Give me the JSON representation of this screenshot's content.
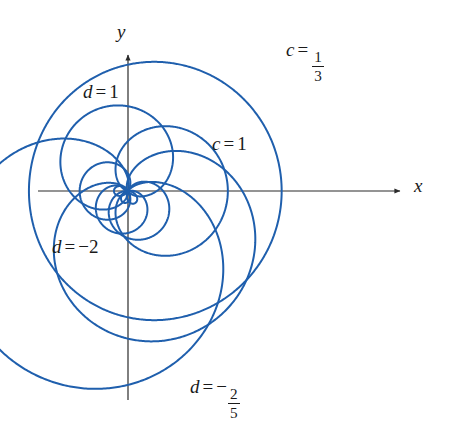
{
  "figure": {
    "name": "polar-limacon-family",
    "background": "#ffffff",
    "width": 451,
    "height": 425
  },
  "axes": {
    "x_label": "x",
    "y_label": "y",
    "color": "#2b2b2b",
    "origin": [
      128,
      191
    ],
    "x_start": 38,
    "x_end": 400,
    "y_start": 55,
    "y_end": 400,
    "arrow_x": true,
    "arrow_y": true,
    "ticks": false,
    "grid": false
  },
  "style": {
    "curve_color": "#1f5fad",
    "curve_width": 2.0,
    "text_color": "#1a1a1a"
  },
  "labels": {
    "c_onethird": {
      "var": "c",
      "eq": "=",
      "num": "1",
      "den": "3"
    },
    "c_one": {
      "var": "c",
      "eq": "=",
      "value": "1"
    },
    "d_one": {
      "var": "d",
      "eq": "=",
      "value": "1"
    },
    "d_minustwo": {
      "var": "d",
      "eq": "=",
      "value": "−2"
    },
    "d_minustwofifths": {
      "var": "d",
      "eq": "=",
      "neg": "−",
      "num": "2",
      "den": "5"
    }
  },
  "chart_data": {
    "type": "line",
    "title": "",
    "xlabel": "x",
    "ylabel": "y",
    "grid": false,
    "legend": "inline-annotations",
    "coordinate_system": "polar",
    "xlim": [
      -2.7,
      2.7
    ],
    "ylim": [
      -2.7,
      2.7
    ],
    "scale_px_per_unit": 78,
    "equation_family": "r = k / (1 + e*cos(theta - phi))  rendered as limacon r = a + b*cos(theta - phi)",
    "series": [
      {
        "name": "c = 1/3",
        "label": "c = 1/3",
        "param": "c",
        "value": 0.3333,
        "color": "#1f5fad",
        "a": 1.62,
        "b": 0.35,
        "phase_deg": 0,
        "description": "large near-circular limacon passing through origin, opening right"
      },
      {
        "name": "c = 1",
        "label": "c = 1",
        "param": "c",
        "value": 1,
        "color": "#1f5fad",
        "a": 0.64,
        "b": 0.64,
        "phase_deg": 0,
        "description": "cardioid opening right, cusp at origin"
      },
      {
        "name": "d = 1",
        "label": "d = 1",
        "param": "d",
        "value": 1,
        "color": "#1f5fad",
        "a": 0.56,
        "b": 0.56,
        "phase_deg": 110,
        "description": "cardioid rotated up-left"
      },
      {
        "name": "d = -2",
        "label": "d = −2",
        "param": "d",
        "value": -2,
        "color": "#1f5fad",
        "a": 1.32,
        "b": 1.32,
        "phase_deg": 242,
        "description": "large cardioid opening down-left"
      },
      {
        "name": "d = -2/5",
        "label": "d = −2/5",
        "param": "d",
        "value": -0.4,
        "color": "#1f5fad",
        "a": 1.02,
        "b": 0.98,
        "phase_deg": 297,
        "description": "cardioid opening down-right"
      },
      {
        "name": "inner-loop-a",
        "label": "",
        "param": "",
        "value": 0,
        "color": "#1f5fad",
        "a": 0.22,
        "b": 0.4,
        "phase_deg": 180,
        "description": "small limacon with inner loop, left of origin"
      },
      {
        "name": "inner-loop-b",
        "label": "",
        "param": "",
        "value": 0,
        "color": "#1f5fad",
        "a": 0.2,
        "b": 0.36,
        "phase_deg": 250,
        "description": "small limacon with inner loop, lower-left of origin"
      },
      {
        "name": "inner-loop-c",
        "label": "",
        "param": "",
        "value": 0,
        "color": "#1f5fad",
        "a": 0.24,
        "b": 0.42,
        "phase_deg": 300,
        "description": "small limacon lower area near origin"
      }
    ]
  }
}
